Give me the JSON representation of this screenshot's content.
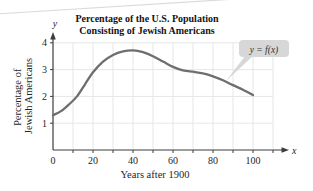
{
  "figure": {
    "title_line1": "Percentage of the U.S. Population",
    "title_line2": "Consisting of Jewish Americans",
    "y_axis_label_line1": "Percentage of",
    "y_axis_label_line2": "Jewish Americans",
    "x_axis_label": "Years after 1900",
    "curve_label": "y = f(x)",
    "x_axis_letter": "x",
    "y_axis_letter": "y"
  },
  "colors": {
    "curve": "#6e6e6e",
    "grid": "#e4e8e5",
    "axis": "#3c3c3c",
    "text": "#262626",
    "title": "#141414",
    "callout_fill": "#d7d7d7",
    "background": "#ffffff"
  },
  "chart_data": {
    "type": "line",
    "title": "Percentage of the U.S. Population Consisting of Jewish Americans",
    "xlabel": "Years after 1900",
    "ylabel": "Percentage of Jewish Americans",
    "xlim": [
      0,
      110
    ],
    "ylim": [
      0,
      4.4
    ],
    "x_ticks": [
      0,
      20,
      40,
      60,
      80,
      100
    ],
    "y_ticks": [
      1,
      2,
      3,
      4
    ],
    "grid": true,
    "grid_x_step": 10,
    "grid_y_step": 1,
    "annotation": "y = f(x)",
    "series": [
      {
        "name": "y = f(x)",
        "points": [
          [
            0,
            1.3
          ],
          [
            4,
            1.45
          ],
          [
            8,
            1.7
          ],
          [
            12,
            2.0
          ],
          [
            16,
            2.45
          ],
          [
            20,
            2.9
          ],
          [
            25,
            3.3
          ],
          [
            30,
            3.55
          ],
          [
            35,
            3.68
          ],
          [
            40,
            3.72
          ],
          [
            45,
            3.65
          ],
          [
            50,
            3.5
          ],
          [
            55,
            3.3
          ],
          [
            60,
            3.1
          ],
          [
            65,
            2.97
          ],
          [
            70,
            2.92
          ],
          [
            75,
            2.86
          ],
          [
            80,
            2.75
          ],
          [
            85,
            2.6
          ],
          [
            90,
            2.42
          ],
          [
            95,
            2.25
          ],
          [
            100,
            2.05
          ]
        ]
      }
    ]
  }
}
